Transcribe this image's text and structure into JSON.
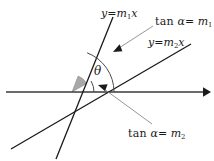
{
  "figure": {
    "type": "geometry-diagram",
    "background_color": "#ffffff",
    "stroke_color": "#1a1a1a",
    "axis_color": "#3a3a3a",
    "wedge_fill_color": "#a8a8a8",
    "arc_color": "#4a4a4a",
    "leader_color": "#8a8a8a"
  },
  "labels": {
    "line1_equation": {
      "y": "y",
      "equals": "=",
      "slope": "m",
      "slope_index": "1",
      "variable": "x"
    },
    "line2_equation": {
      "y": "y",
      "equals": "=",
      "slope": "m",
      "slope_index": "2",
      "variable": "x"
    },
    "tan_line1": {
      "function": "tan",
      "angle_symbol": "α",
      "equals": "=",
      "slope": "m",
      "slope_index": "1"
    },
    "tan_line2": {
      "function": "tan",
      "angle_symbol": "α",
      "equals": "=",
      "slope": "m",
      "slope_index": "2"
    },
    "angle_between_lines": "θ"
  },
  "geometry": {
    "origin": {
      "x": 72,
      "y": 92
    },
    "x_axis": {
      "x1": 6,
      "y1": 92,
      "x2": 208,
      "y2": 92,
      "arrow_at": "right"
    },
    "line1": {
      "x1": 57,
      "y1": 158,
      "x2": 112,
      "y2": 18,
      "label_anchor": "top"
    },
    "line2": {
      "x1": 12,
      "y1": 148,
      "x2": 190,
      "y2": 44,
      "label_anchor": "top-right"
    },
    "arc_line1": {
      "radius": 42,
      "start_deg": 0,
      "end_deg": 69
    },
    "arc_line2": {
      "radius": 22,
      "start_deg": 0,
      "end_deg": 30
    },
    "wedge": {
      "radius": 17,
      "start_deg": 30,
      "end_deg": 69
    },
    "leader_tan1": {
      "x1": 152,
      "y1": 27,
      "x2": 116,
      "y2": 50
    },
    "leader_tan2": {
      "x1": 152,
      "y1": 124,
      "x2": 100,
      "y2": 86
    }
  }
}
